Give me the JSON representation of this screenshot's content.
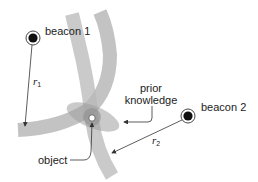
{
  "diagram": {
    "labels": {
      "beacon1": "beacon 1",
      "beacon2": "beacon 2",
      "r1_symbol": "r",
      "r1_subscript": "1",
      "r2_symbol": "r",
      "r2_subscript": "2",
      "prior_line1": "prior",
      "prior_line2": "knowledge",
      "object": "object"
    },
    "colors": {
      "band": "#b8b8b8",
      "band_overlap": "#9a9a9a",
      "ellipse": "#a8a8a8",
      "line": "#333333",
      "beacon_fill": "#111111",
      "text": "#222222"
    },
    "elements": [
      {
        "type": "beacon",
        "name": "beacon 1",
        "x": 33,
        "y": 38
      },
      {
        "type": "beacon",
        "name": "beacon 2",
        "x": 188,
        "y": 116
      },
      {
        "type": "range-band",
        "from": "beacon 1",
        "radius_label": "r1"
      },
      {
        "type": "range-band",
        "from": "beacon 2",
        "radius_label": "r2"
      },
      {
        "type": "ellipse",
        "label": "prior knowledge"
      },
      {
        "type": "point",
        "label": "object",
        "x": 92,
        "y": 118
      }
    ]
  }
}
